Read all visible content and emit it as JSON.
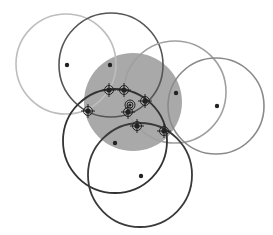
{
  "canvas": {
    "width": 273,
    "height": 235,
    "background": "#ffffff"
  },
  "filled_circle": {
    "cx": 133,
    "cy": 102,
    "r": 49,
    "fill": "#a9a9a9"
  },
  "circles": [
    {
      "id": "c1",
      "cx": 66,
      "cy": 64,
      "r": 50,
      "stroke": "#bdbdbd",
      "width": 1.6,
      "dot": [
        67,
        65
      ]
    },
    {
      "id": "c2",
      "cx": 111,
      "cy": 65,
      "r": 52,
      "stroke": "#555555",
      "width": 1.6,
      "dot": [
        110,
        65
      ]
    },
    {
      "id": "c3",
      "cx": 175,
      "cy": 92,
      "r": 51,
      "stroke": "#a0a0a0",
      "width": 1.6,
      "dot": [
        176,
        93
      ]
    },
    {
      "id": "c4",
      "cx": 216,
      "cy": 106,
      "r": 48,
      "stroke": "#8a8a8a",
      "width": 1.6,
      "dot": [
        217,
        106
      ]
    },
    {
      "id": "c5",
      "cx": 115,
      "cy": 141,
      "r": 52,
      "stroke": "#333333",
      "width": 1.8,
      "dot": [
        115,
        143
      ]
    },
    {
      "id": "c6",
      "cx": 140,
      "cy": 175,
      "r": 52,
      "stroke": "#3a3a3a",
      "width": 1.8,
      "dot": [
        141,
        176
      ]
    }
  ],
  "markers": [
    {
      "x": 88,
      "y": 111,
      "type": "crosshair"
    },
    {
      "x": 109,
      "y": 90,
      "type": "crosshair"
    },
    {
      "x": 124,
      "y": 90,
      "type": "crosshair"
    },
    {
      "x": 145,
      "y": 101,
      "type": "crosshair"
    },
    {
      "x": 130,
      "y": 105,
      "type": "double-ring"
    },
    {
      "x": 128,
      "y": 112,
      "type": "crosshair"
    },
    {
      "x": 137,
      "y": 126,
      "type": "crosshair"
    },
    {
      "x": 164,
      "y": 131,
      "type": "crosshair"
    }
  ],
  "colors": {
    "dot": "#222222",
    "marker": "#222222"
  }
}
